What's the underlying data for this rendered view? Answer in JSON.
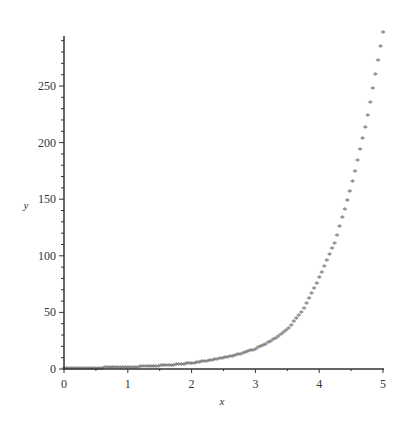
{
  "chart_data": {
    "type": "scatter",
    "title": "",
    "xlabel": "x",
    "ylabel": "y",
    "xlim": [
      0,
      5
    ],
    "ylim": [
      0,
      297
    ],
    "x_ticks": [
      "0",
      "1",
      "2",
      "3",
      "4",
      "5"
    ],
    "y_ticks": [
      "0",
      "50",
      "100",
      "150",
      "200",
      "250"
    ],
    "grid": false,
    "legend": null,
    "marker": "asterisk",
    "marker_color": "#666666",
    "series": [
      {
        "name": "data",
        "x": [
          0,
          0.25,
          0.5,
          0.75,
          1.0,
          1.25,
          1.5,
          1.75,
          2.0,
          2.25,
          2.5,
          2.75,
          3.0,
          3.25,
          3.5,
          3.75,
          4.0,
          4.25,
          4.5,
          4.75,
          5.0
        ],
        "y": [
          0,
          0.1,
          0.3,
          0.6,
          1,
          1.5,
          2.2,
          3.2,
          4.5,
          6.5,
          9,
          12.5,
          17,
          24,
          34,
          52,
          80,
          112,
          160,
          220,
          297
        ]
      }
    ]
  }
}
